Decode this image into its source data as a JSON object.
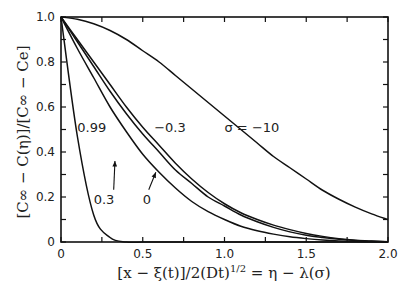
{
  "chart_data": {
    "type": "line",
    "title": "",
    "xlabel": "[x − ξ(t)]/2(Dt)^1/2 = η − λ(σ)",
    "ylabel": "[C∞ − C(η)]/[C∞ − Ce]",
    "xlim": [
      0,
      2.0
    ],
    "ylim": [
      0,
      1.0
    ],
    "grid": false,
    "legend": "none (curves labeled inline)",
    "x_ticks": [
      "0",
      "0.5",
      "1.0",
      "1.5",
      "2.0"
    ],
    "y_ticks": [
      "0",
      "0.2",
      "0.4",
      "0.6",
      "0.8",
      "1.0"
    ],
    "x": [
      0,
      0.1,
      0.2,
      0.3,
      0.4,
      0.5,
      0.6,
      0.7,
      0.8,
      0.9,
      1.0,
      1.1,
      1.2,
      1.3,
      1.4,
      1.5,
      1.6,
      1.7,
      1.8,
      1.9,
      2.0
    ],
    "series": [
      {
        "name": "σ = 0.99",
        "label": "0.99",
        "values": [
          1.0,
          0.47,
          0.12,
          0.02,
          0.0,
          0.0,
          0.0,
          0.0,
          0.0,
          0.0,
          0.0,
          0.0,
          0.0,
          0.0,
          0.0,
          0.0,
          0.0,
          0.0,
          0.0,
          0.0,
          0.0
        ]
      },
      {
        "name": "σ = 0.3",
        "label": "0.3",
        "values": [
          1.0,
          0.86,
          0.73,
          0.6,
          0.49,
          0.39,
          0.31,
          0.24,
          0.18,
          0.135,
          0.1,
          0.07,
          0.05,
          0.035,
          0.023,
          0.015,
          0.009,
          0.005,
          0.003,
          0.001,
          0.0
        ]
      },
      {
        "name": "σ = 0",
        "label": "0",
        "values": [
          1.0,
          0.89,
          0.78,
          0.67,
          0.57,
          0.48,
          0.4,
          0.32,
          0.26,
          0.2,
          0.16,
          0.12,
          0.09,
          0.065,
          0.045,
          0.03,
          0.02,
          0.012,
          0.007,
          0.003,
          0.001
        ]
      },
      {
        "name": "σ = −0.3",
        "label": "−0.3",
        "values": [
          1.0,
          0.9,
          0.8,
          0.7,
          0.6,
          0.51,
          0.43,
          0.35,
          0.28,
          0.22,
          0.17,
          0.13,
          0.1,
          0.075,
          0.055,
          0.038,
          0.025,
          0.015,
          0.008,
          0.004,
          0.001
        ]
      },
      {
        "name": "σ = −10",
        "label": "σ = −10",
        "values": [
          1.0,
          0.99,
          0.97,
          0.94,
          0.9,
          0.85,
          0.8,
          0.74,
          0.68,
          0.62,
          0.56,
          0.5,
          0.44,
          0.38,
          0.33,
          0.28,
          0.23,
          0.19,
          0.155,
          0.125,
          0.1
        ]
      }
    ],
    "annotations": [
      {
        "text": "0.99",
        "x": 0.1,
        "y": 0.49
      },
      {
        "text": "−0.3",
        "x": 0.57,
        "y": 0.49
      },
      {
        "text": "σ = −10",
        "x": 1.0,
        "y": 0.49
      },
      {
        "text": "0.3",
        "x": 0.2,
        "y": 0.17,
        "arrow_to": [
          0.33,
          0.36
        ]
      },
      {
        "text": "0",
        "x": 0.5,
        "y": 0.17,
        "arrow_to": [
          0.58,
          0.31
        ]
      }
    ]
  },
  "labels": {
    "ylabel_text": "[C∞ − C(η)]/[C∞ − Ce]",
    "xlabel_text": "[x − ξ(t)]/2(Dt)",
    "xlabel_exp": "1/2",
    "xlabel_rest": " = η − λ(σ)"
  }
}
